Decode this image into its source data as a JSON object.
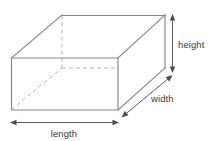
{
  "diagram": {
    "shape_name": "rectangular-prism",
    "labels": {
      "height": "height",
      "width": "width",
      "length": "length"
    },
    "colors": {
      "background": "#ffffff",
      "visible_edge": "#878787",
      "hidden_edge": "#b3b3b3",
      "face_fill": "#ffffff",
      "dimension_line": "#4a4a4a",
      "label_text": "#3b3b3b"
    },
    "geometry": {
      "front_face": {
        "top_left": [
          11,
          58
        ],
        "top_right": [
          118,
          58
        ],
        "bottom_right": [
          118,
          110
        ],
        "bottom_left": [
          11,
          110
        ]
      },
      "back_face": {
        "top_left": [
          62,
          15
        ],
        "top_right": [
          165,
          15
        ],
        "bottom_right": [
          165,
          68
        ],
        "bottom_left": [
          62,
          68
        ]
      },
      "depth_offset": [
        51,
        -43
      ],
      "hidden_edges": [
        [
          [
            62,
            15
          ],
          [
            62,
            68
          ]
        ],
        [
          [
            62,
            68
          ],
          [
            118,
            68
          ]
        ],
        [
          [
            11,
            110
          ],
          [
            62,
            68
          ]
        ]
      ]
    },
    "dimension_arrows": {
      "height": {
        "from": [
          172,
          15
        ],
        "to": [
          172,
          72
        ],
        "orientation": "vertical",
        "double_headed": true
      },
      "width": {
        "from": [
          122,
          118
        ],
        "to": [
          172,
          76
        ],
        "orientation": "diagonal",
        "double_headed": true
      },
      "length": {
        "from": [
          11,
          122
        ],
        "to": [
          118,
          122
        ],
        "orientation": "horizontal",
        "double_headed": true
      }
    },
    "label_positions": {
      "height": [
        178,
        45
      ],
      "width": [
        151,
        99
      ],
      "length": [
        49,
        134
      ]
    }
  }
}
